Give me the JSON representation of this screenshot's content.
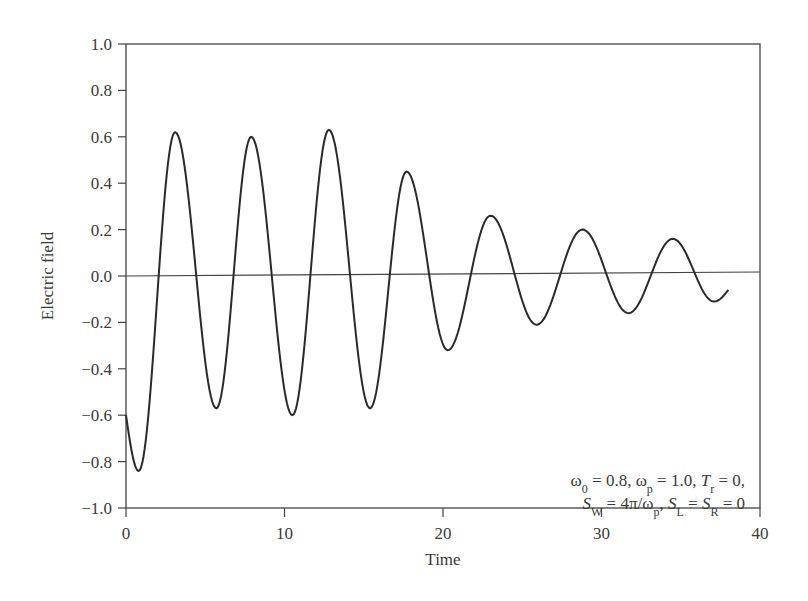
{
  "chart_data": {
    "type": "line",
    "title": "",
    "xlabel": "Time",
    "ylabel": "Electric field",
    "xlim": [
      0,
      40
    ],
    "ylim": [
      -1.0,
      1.0
    ],
    "xticks": [
      "0",
      "10",
      "20",
      "30",
      "40"
    ],
    "yticks": [
      "1.0",
      "0.8",
      "0.6",
      "0.4",
      "0.2",
      "0.0",
      "-0.2",
      "-0.4",
      "-0.6",
      "-0.8",
      "-1.0"
    ],
    "grid": false,
    "zero_line": true,
    "annotation": {
      "line1": "ω0 = 0.8, ωp = 1.0, Tr = 0,",
      "line2": "SW = 4π/ωp, SL = SR = 0"
    },
    "series": [
      {
        "name": "Electric field",
        "color": "#2a2a2a",
        "x": [
          0,
          0.8,
          3.1,
          5.7,
          7.9,
          10.5,
          12.8,
          15.4,
          17.7,
          20.3,
          23.0,
          25.9,
          28.8,
          31.7,
          34.5,
          37.1,
          38.0
        ],
        "y": [
          -0.6,
          -0.84,
          0.62,
          -0.57,
          0.6,
          -0.6,
          0.63,
          -0.57,
          0.45,
          -0.32,
          0.26,
          -0.21,
          0.2,
          -0.16,
          0.16,
          -0.11,
          -0.06
        ]
      }
    ]
  }
}
